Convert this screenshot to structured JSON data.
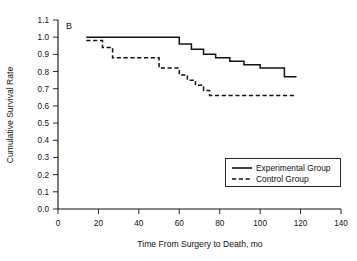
{
  "chart_data": {
    "type": "line",
    "subtype": "kaplan-meier-step",
    "title": "",
    "panel_label": "B",
    "xlabel": "Time From Surgery to Death, mo",
    "ylabel": "Cumulative Survival Rate",
    "xlim": [
      0,
      140
    ],
    "ylim": [
      0.0,
      1.1
    ],
    "xticks": [
      0,
      20,
      40,
      60,
      80,
      100,
      120,
      140
    ],
    "xtick_labels": [
      "0",
      "20",
      "40",
      "60",
      "80",
      "100",
      "120",
      "140"
    ],
    "yticks": [
      0.0,
      0.1,
      0.2,
      0.3,
      0.4,
      0.5,
      0.6,
      0.7,
      0.8,
      0.9,
      1.0,
      1.1
    ],
    "ytick_labels": [
      "0.0",
      "0.1",
      "0.2",
      "0.3",
      "0.4",
      "0.5",
      "0.6",
      "0.7",
      "0.8",
      "0.9",
      "1.0",
      "1.1"
    ],
    "grid": false,
    "legend_position": "lower-right",
    "series": [
      {
        "name": "Experimental Group",
        "style": "solid",
        "color": "#111111",
        "x": [
          14,
          15,
          55,
          60,
          66,
          72,
          78,
          85,
          92,
          100,
          108,
          112,
          118
        ],
        "y": [
          1.0,
          1.0,
          1.0,
          0.96,
          0.93,
          0.9,
          0.88,
          0.86,
          0.84,
          0.82,
          0.82,
          0.77,
          0.77
        ]
      },
      {
        "name": "Control Group",
        "style": "dashed",
        "color": "#111111",
        "x": [
          14,
          18,
          22,
          27,
          33,
          46,
          50,
          55,
          60,
          64,
          68,
          72,
          75,
          118
        ],
        "y": [
          0.98,
          0.98,
          0.94,
          0.88,
          0.88,
          0.88,
          0.82,
          0.82,
          0.78,
          0.75,
          0.72,
          0.69,
          0.66,
          0.66
        ]
      }
    ]
  },
  "legend": {
    "entries": [
      {
        "label": "Experimental Group",
        "style": "solid"
      },
      {
        "label": "Control Group",
        "style": "dashed"
      }
    ]
  }
}
